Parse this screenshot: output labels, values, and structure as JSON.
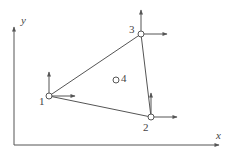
{
  "colors": {
    "line": "#555555",
    "arrow": "#555555",
    "node_fill": "#ffffff",
    "node_stroke": "#555555",
    "text": "#444444"
  },
  "axes": {
    "x_label": "x",
    "y_label": "y",
    "origin": [
      14,
      145
    ],
    "x_end": [
      219,
      145
    ],
    "y_end": [
      14,
      27
    ]
  },
  "nodes": [
    {
      "id": "1",
      "label": "1",
      "x": 49,
      "y": 96,
      "label_dx": -10,
      "label_dy": 9,
      "dof_arrows": true
    },
    {
      "id": "2",
      "label": "2",
      "x": 151,
      "y": 117,
      "label_dx": -8,
      "label_dy": 14,
      "dof_arrows": true
    },
    {
      "id": "3",
      "label": "3",
      "x": 141,
      "y": 34,
      "label_dx": -12,
      "label_dy": -1,
      "dof_arrows": true
    },
    {
      "id": "4",
      "label": "4",
      "x": 116,
      "y": 80,
      "label_dx": 5,
      "label_dy": 2,
      "dof_arrows": false
    }
  ],
  "element_edges": [
    [
      "1",
      "2"
    ],
    [
      "2",
      "3"
    ],
    [
      "3",
      "1"
    ]
  ],
  "arrow_lengths": {
    "up": 24,
    "right": 26
  }
}
